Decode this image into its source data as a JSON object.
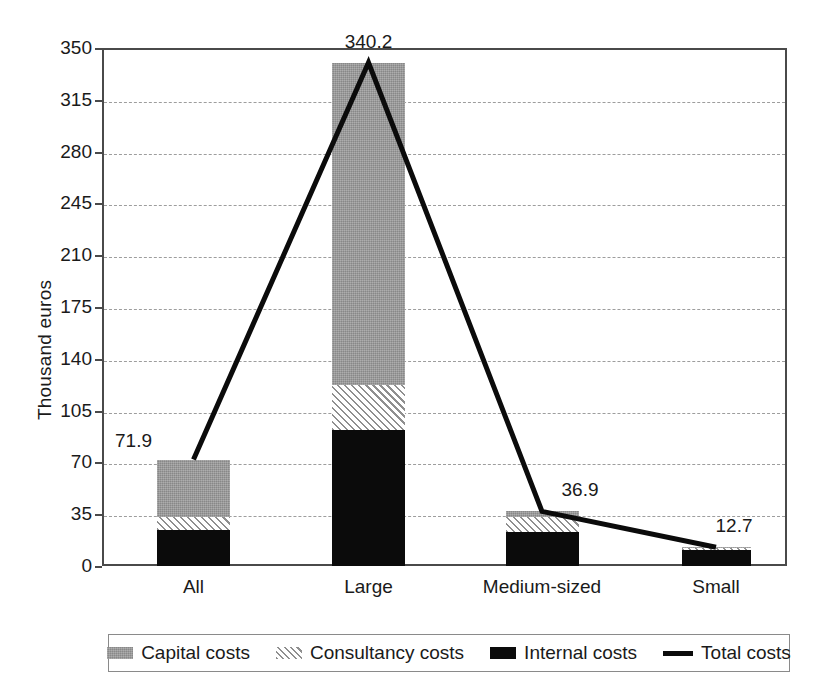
{
  "chart_data": {
    "type": "bar",
    "title": "",
    "xlabel": "",
    "ylabel": "Thousand euros",
    "ylim": [
      0,
      350
    ],
    "yticks": [
      0,
      35,
      70,
      105,
      140,
      175,
      210,
      245,
      280,
      315,
      350
    ],
    "grid": true,
    "stacked": true,
    "legend_position": "bottom",
    "categories": [
      "All",
      "Large",
      "Medium-sized",
      "Small"
    ],
    "series": [
      {
        "name": "Internal costs",
        "values": [
          24.0,
          92.0,
          23.0,
          10.5
        ]
      },
      {
        "name": "Consultancy costs",
        "values": [
          9.0,
          30.0,
          10.0,
          1.4
        ]
      },
      {
        "name": "Capital costs",
        "values": [
          38.9,
          218.2,
          3.9,
          0.8
        ]
      }
    ],
    "line_series": {
      "name": "Total costs",
      "values": [
        71.9,
        340.2,
        36.9,
        12.7
      ]
    },
    "data_labels": [
      "71.9",
      "340.2",
      "36.9",
      "12.7"
    ],
    "colors": {
      "capital": "#9a9a9a",
      "consultancy": "#ffffff",
      "consultancy_hatch": "#8f8f8f",
      "internal": "#0b0b0b",
      "total_line": "#0b0b0b",
      "axis": "#4a4a4a",
      "grid": "#9d9d9d"
    }
  },
  "axis": {
    "y_title": "Thousand euros",
    "y_ticks": [
      "0",
      "35",
      "70",
      "105",
      "140",
      "175",
      "210",
      "245",
      "280",
      "315",
      "350"
    ],
    "x_categories": [
      "All",
      "Large",
      "Medium-sized",
      "Small"
    ]
  },
  "labels": {
    "all": "71.9",
    "large": "340.2",
    "medium": "36.9",
    "small": "12.7"
  },
  "legend": {
    "items": [
      {
        "label": "Capital costs",
        "icon": "gray-square-swatch"
      },
      {
        "label": "Consultancy costs",
        "icon": "hatched-square-swatch"
      },
      {
        "label": "Internal costs",
        "icon": "black-square-swatch"
      },
      {
        "label": "Total costs",
        "icon": "line-swatch"
      }
    ]
  }
}
